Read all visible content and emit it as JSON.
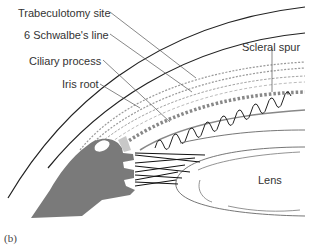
{
  "figure": {
    "panel_label": "(b)",
    "labels": {
      "trabeculotomy_site": "Trabeculotomy site",
      "schwalbes_line": "6 Schwalbe's line",
      "ciliary_process": "Ciliary process",
      "iris_root": "Iris root",
      "scleral_spur": "Scleral spur",
      "lens": "Lens"
    },
    "colors": {
      "line": "#222222",
      "leader": "#555555",
      "dotted": "#999999",
      "tissue": "#7a7a7a",
      "highlight": "#c8c8c8"
    }
  }
}
